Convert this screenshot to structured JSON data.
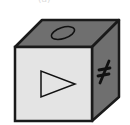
{
  "figure": {
    "label": "(a)",
    "cube": {
      "faces": {
        "top": {
          "symbol": "ellipse",
          "color": "#6f6f6f"
        },
        "front": {
          "symbol": "triangle-right",
          "color": "#e4e4e4"
        },
        "right": {
          "symbol": "star-asterisk",
          "color": "#6f6f6f"
        }
      },
      "edge_color": "#1a1a1a",
      "symbol_glyph_right": "*"
    }
  }
}
